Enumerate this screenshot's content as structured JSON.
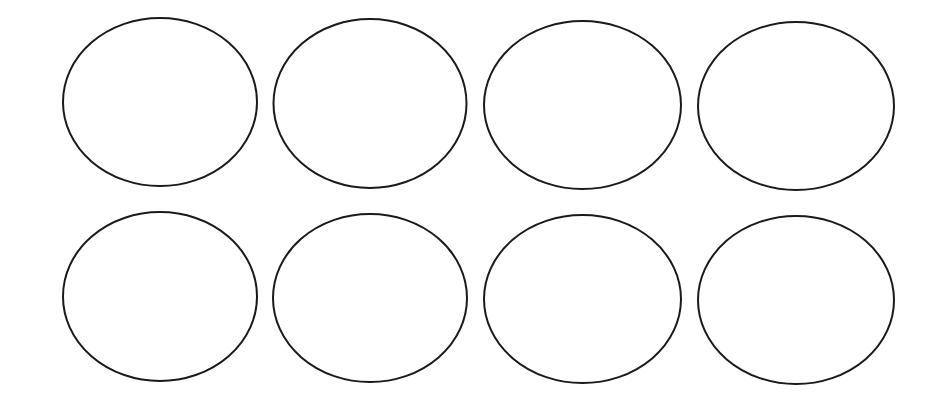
{
  "canvas": {
    "width": 944,
    "height": 396,
    "background": "#ffffff"
  },
  "style": {
    "stroke": "#1a1a1a",
    "stroke_width": 2,
    "fill": "#ffffff"
  },
  "rows": 2,
  "columns": 4,
  "ellipses": [
    {
      "row": 0,
      "col": 0,
      "cx": 160,
      "cy": 102,
      "rx": 97,
      "ry": 84
    },
    {
      "row": 0,
      "col": 1,
      "cx": 370,
      "cy": 103.5,
      "rx": 96.5,
      "ry": 84.5
    },
    {
      "row": 0,
      "col": 2,
      "cx": 582.5,
      "cy": 105,
      "rx": 98.5,
      "ry": 84
    },
    {
      "row": 0,
      "col": 3,
      "cx": 796,
      "cy": 106,
      "rx": 98,
      "ry": 84
    },
    {
      "row": 1,
      "col": 0,
      "cx": 160,
      "cy": 296.5,
      "rx": 97,
      "ry": 84.5
    },
    {
      "row": 1,
      "col": 1,
      "cx": 370,
      "cy": 298,
      "rx": 97,
      "ry": 84
    },
    {
      "row": 1,
      "col": 2,
      "cx": 582.5,
      "cy": 299,
      "rx": 98.5,
      "ry": 84
    },
    {
      "row": 1,
      "col": 3,
      "cx": 796,
      "cy": 300,
      "rx": 98,
      "ry": 84
    }
  ]
}
